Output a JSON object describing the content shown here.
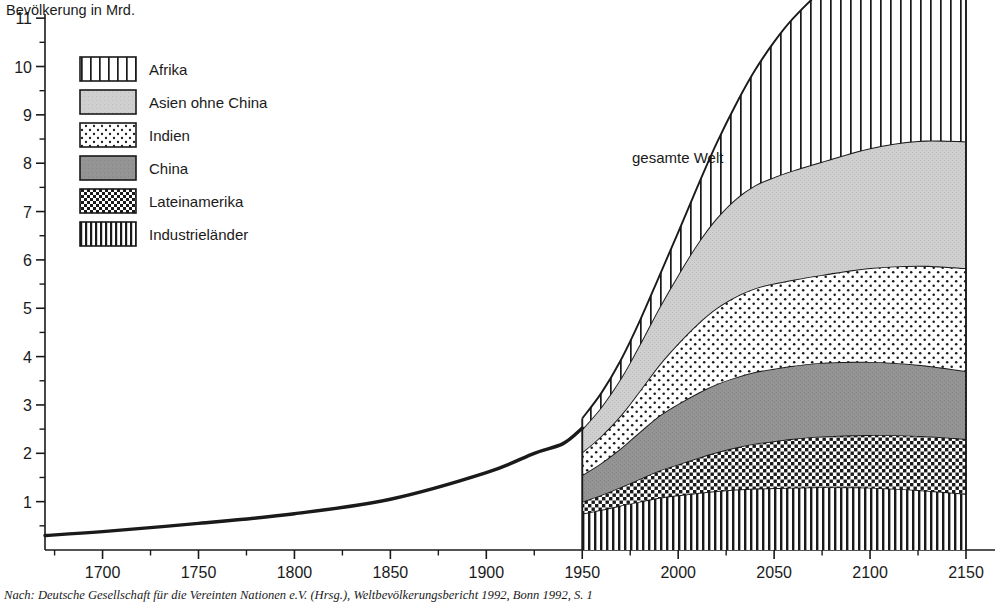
{
  "figure": {
    "y_axis_title": "Bevölkerung in Mrd.",
    "annotation_total": "gesamte Welt",
    "source_caption": "Nach: Deutsche Gesellschaft für die Vereinten Nationen e.V. (Hrsg.), Weltbevölkerungsbericht 1992, Bonn 1992, S. 1"
  },
  "legend": {
    "items": [
      {
        "label": "Afrika",
        "pattern": "wide-vertical-stripes",
        "color": "#ffffff"
      },
      {
        "label": "Asien ohne China",
        "pattern": "solid-light-gray",
        "color": "#d0d0d0"
      },
      {
        "label": "Indien",
        "pattern": "sparse-dots",
        "color": "#ffffff"
      },
      {
        "label": "China",
        "pattern": "solid-mid-gray",
        "color": "#949494"
      },
      {
        "label": "Lateinamerika",
        "pattern": "dense-checker-dots",
        "color": "#ffffff"
      },
      {
        "label": "Industrieländer",
        "pattern": "narrow-vertical-stripes",
        "color": "#ffffff"
      }
    ]
  },
  "chart_data": {
    "type": "area",
    "title": "",
    "subtitle": "",
    "xlabel": "",
    "ylabel": "Bevölkerung in Mrd.",
    "xlim": [
      1670,
      2150
    ],
    "ylim": [
      0,
      11.5
    ],
    "xticks": [
      1700,
      1750,
      1800,
      1850,
      1900,
      1950,
      2000,
      2050,
      2100,
      2150
    ],
    "xtick_labels": [
      "1700",
      "1750",
      "1800",
      "1850",
      "1900",
      "1950",
      "2000",
      "2050",
      "2100",
      "2150"
    ],
    "yticks": [
      1,
      2,
      3,
      4,
      5,
      6,
      7,
      8,
      9,
      10,
      11
    ],
    "ytick_labels": [
      "1",
      "2",
      "3",
      "4",
      "5",
      "6",
      "7",
      "8",
      "9",
      "10",
      "11"
    ],
    "minor_yticks": [
      0.5,
      1.5,
      2.5,
      3.5,
      4.5,
      5.5,
      6.5,
      7.5,
      8.5,
      9.5,
      10.5
    ],
    "grid": false,
    "legend_position": "upper-left-inside",
    "historical_line": {
      "name": "gesamte Welt (historisch)",
      "x": [
        1670,
        1700,
        1750,
        1800,
        1850,
        1900,
        1925,
        1940,
        1950
      ],
      "y": [
        0.3,
        0.38,
        0.55,
        0.75,
        1.05,
        1.6,
        2.0,
        2.2,
        2.52
      ]
    },
    "stack_x": [
      1950,
      1960,
      1970,
      1980,
      1990,
      2000,
      2010,
      2020,
      2030,
      2040,
      2050,
      2060,
      2075,
      2100,
      2125,
      2150
    ],
    "series": [
      {
        "name": "Industrieländer",
        "pattern": "narrow-vertical-stripes",
        "values": [
          0.75,
          0.83,
          0.92,
          1.0,
          1.08,
          1.13,
          1.18,
          1.22,
          1.25,
          1.27,
          1.28,
          1.29,
          1.3,
          1.29,
          1.24,
          1.16
        ]
      },
      {
        "name": "Lateinamerika",
        "pattern": "dense-checker-dots",
        "values": [
          0.25,
          0.31,
          0.38,
          0.47,
          0.56,
          0.64,
          0.72,
          0.8,
          0.87,
          0.93,
          0.97,
          1.01,
          1.05,
          1.09,
          1.12,
          1.14
        ]
      },
      {
        "name": "China",
        "pattern": "solid-mid-gray",
        "values": [
          0.55,
          0.66,
          0.8,
          0.97,
          1.13,
          1.25,
          1.34,
          1.41,
          1.45,
          1.48,
          1.5,
          1.51,
          1.52,
          1.51,
          1.47,
          1.4
        ]
      },
      {
        "name": "Indien",
        "pattern": "sparse-dots",
        "values": [
          0.47,
          0.56,
          0.68,
          0.85,
          1.05,
          1.25,
          1.43,
          1.57,
          1.67,
          1.73,
          1.76,
          1.78,
          1.82,
          1.94,
          2.05,
          2.13
        ]
      },
      {
        "name": "Asien ohne China",
        "pattern": "solid-light-gray",
        "values": [
          0.48,
          0.6,
          0.76,
          0.96,
          1.18,
          1.42,
          1.66,
          1.86,
          2.02,
          2.13,
          2.2,
          2.26,
          2.34,
          2.48,
          2.58,
          2.62
        ]
      },
      {
        "name": "Afrika",
        "pattern": "wide-vertical-stripes",
        "values": [
          0.22,
          0.29,
          0.38,
          0.49,
          0.65,
          0.88,
          1.18,
          1.55,
          1.95,
          2.38,
          2.8,
          3.15,
          3.55,
          4.05,
          4.4,
          4.65
        ]
      }
    ],
    "total_values": [
      2.72,
      3.25,
      3.92,
      4.74,
      5.65,
      6.57,
      7.51,
      8.41,
      9.21,
      9.92,
      10.51,
      11.0,
      11.58,
      12.36,
      12.86,
      13.1
    ],
    "annotations": [
      {
        "text": "gesamte Welt",
        "x": 2010,
        "y": 8.5
      }
    ]
  }
}
